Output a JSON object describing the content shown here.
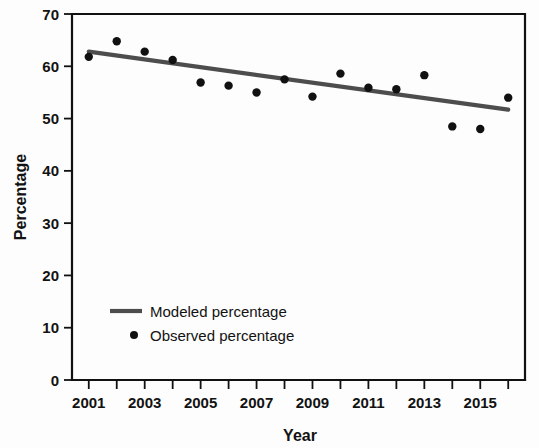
{
  "chart_data": {
    "type": "line",
    "title": "",
    "subtitle": "",
    "xlabel": "Year",
    "ylabel": "Percentage",
    "xlim": [
      2000.4,
      2016.6
    ],
    "ylim": [
      0,
      70
    ],
    "grid": false,
    "legend_position": "inside-lower-left",
    "x": [
      2001,
      2002,
      2003,
      2004,
      2005,
      2006,
      2007,
      2008,
      2009,
      2010,
      2011,
      2012,
      2013,
      2014,
      2015,
      2016
    ],
    "xtick_values": [
      2001,
      2002,
      2003,
      2004,
      2005,
      2006,
      2007,
      2008,
      2009,
      2010,
      2011,
      2012,
      2013,
      2014,
      2015,
      2016
    ],
    "xtick_labels": [
      "2001",
      "",
      "2003",
      "",
      "2005",
      "",
      "2007",
      "",
      "2009",
      "",
      "2011",
      "",
      "2013",
      "",
      "2015",
      ""
    ],
    "ytick_values": [
      0,
      10,
      20,
      30,
      40,
      50,
      60,
      70
    ],
    "ytick_labels": [
      "0",
      "10",
      "20",
      "30",
      "40",
      "50",
      "60",
      "70"
    ],
    "series": [
      {
        "name": "Modeled percentage",
        "type": "line",
        "color": "#4d4d4d",
        "x": [
          2001,
          2016
        ],
        "values": [
          62.8,
          51.7
        ]
      },
      {
        "name": "Observed percentage",
        "type": "scatter",
        "color": "#111111",
        "x": [
          2001,
          2002,
          2003,
          2004,
          2005,
          2006,
          2007,
          2008,
          2009,
          2010,
          2011,
          2012,
          2013,
          2014,
          2015,
          2016
        ],
        "values": [
          61.8,
          64.8,
          62.8,
          61.2,
          56.9,
          56.3,
          55.0,
          57.5,
          54.2,
          58.6,
          55.9,
          55.6,
          58.3,
          48.5,
          48.0,
          54.0
        ]
      }
    ]
  },
  "legend": {
    "items": [
      {
        "label": "Modeled percentage",
        "marker": "line",
        "color": "#4d4d4d"
      },
      {
        "label": "Observed percentage",
        "marker": "dot",
        "color": "#111111"
      }
    ]
  },
  "colors": {
    "axis": "#111111",
    "modeled_line": "#4d4d4d",
    "observed_dot": "#111111",
    "background": "#fdfdfd"
  }
}
